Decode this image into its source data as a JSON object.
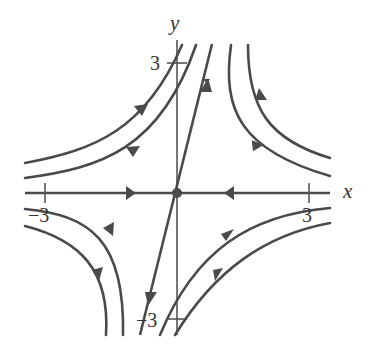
{
  "diagram": {
    "type": "phase_portrait",
    "axes": {
      "x_label": "x",
      "y_label": "y",
      "x_ticks": [
        {
          "value": -3,
          "label": "−3"
        },
        {
          "value": 3,
          "label": "3"
        }
      ],
      "y_ticks": [
        {
          "value": 3,
          "label": "3"
        },
        {
          "value": -3,
          "label": "−3"
        }
      ]
    },
    "equilibrium": {
      "x": 0,
      "y": 0,
      "type": "saddle"
    },
    "eigen_lines": [
      {
        "name": "stable",
        "direction": "along x-axis",
        "flow": "toward origin"
      },
      {
        "name": "unstable",
        "direction": "steep line through origin",
        "flow": "away from origin"
      }
    ],
    "colors": {
      "stroke": "#4a4a4a",
      "background": "#ffffff"
    }
  }
}
